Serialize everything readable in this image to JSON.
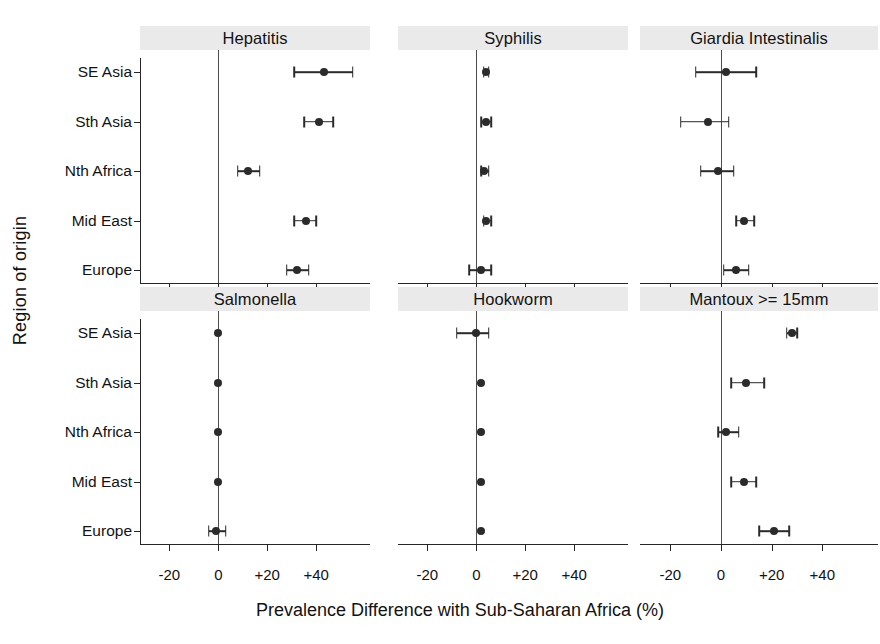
{
  "chart_data": {
    "type": "scatter",
    "subtype": "forest-plot",
    "title": "",
    "xlabel": "Prevalence Difference with Sub-Saharan Africa (%)",
    "ylabel": "Region of origin",
    "xlim": [
      -32,
      62
    ],
    "xticks": [
      -20,
      0,
      20,
      40
    ],
    "xtick_labels": [
      "-20",
      "0",
      "+20",
      "+40"
    ],
    "grid": false,
    "legend": null,
    "reference_line": 0,
    "categories": [
      "SE Asia",
      "Sth Asia",
      "Nth Africa",
      "Mid East",
      "Europe"
    ],
    "panel_layout": {
      "rows": 2,
      "cols": 3
    },
    "panels": [
      {
        "title": "Hepatitis",
        "row": 0,
        "col": 0,
        "points": [
          {
            "category": "SE Asia",
            "value": 43,
            "low": 31,
            "high": 55
          },
          {
            "category": "Sth Asia",
            "value": 41,
            "low": 35,
            "high": 47
          },
          {
            "category": "Nth Africa",
            "value": 12,
            "low": 8,
            "high": 17
          },
          {
            "category": "Mid East",
            "value": 36,
            "low": 31,
            "high": 40
          },
          {
            "category": "Europe",
            "value": 32,
            "low": 28,
            "high": 37
          }
        ]
      },
      {
        "title": "Syphilis",
        "row": 0,
        "col": 1,
        "points": [
          {
            "category": "SE Asia",
            "value": 4,
            "low": 3,
            "high": 5
          },
          {
            "category": "Sth Asia",
            "value": 4,
            "low": 2,
            "high": 6
          },
          {
            "category": "Nth Africa",
            "value": 3,
            "low": 2,
            "high": 5
          },
          {
            "category": "Mid East",
            "value": 4,
            "low": 3,
            "high": 6
          },
          {
            "category": "Europe",
            "value": 2,
            "low": -3,
            "high": 6
          }
        ]
      },
      {
        "title": "Giardia Intestinalis",
        "row": 0,
        "col": 2,
        "points": [
          {
            "category": "SE Asia",
            "value": 2,
            "low": -10,
            "high": 14
          },
          {
            "category": "Sth Asia",
            "value": -5,
            "low": -16,
            "high": 3
          },
          {
            "category": "Nth Africa",
            "value": -1,
            "low": -8,
            "high": 5
          },
          {
            "category": "Mid East",
            "value": 9,
            "low": 6,
            "high": 13
          },
          {
            "category": "Europe",
            "value": 6,
            "low": 1,
            "high": 11
          }
        ]
      },
      {
        "title": "Salmonella",
        "row": 1,
        "col": 0,
        "points": [
          {
            "category": "SE Asia",
            "value": 0,
            "low": 0,
            "high": 0
          },
          {
            "category": "Sth Asia",
            "value": 0,
            "low": 0,
            "high": 0
          },
          {
            "category": "Nth Africa",
            "value": 0,
            "low": 0,
            "high": 0
          },
          {
            "category": "Mid East",
            "value": 0,
            "low": 0,
            "high": 0
          },
          {
            "category": "Europe",
            "value": -1,
            "low": -4,
            "high": 3
          }
        ]
      },
      {
        "title": "Hookworm",
        "row": 1,
        "col": 1,
        "points": [
          {
            "category": "SE Asia",
            "value": 0,
            "low": -8,
            "high": 5
          },
          {
            "category": "Sth Asia",
            "value": 2,
            "low": 2,
            "high": 2
          },
          {
            "category": "Nth Africa",
            "value": 2,
            "low": 2,
            "high": 2
          },
          {
            "category": "Mid East",
            "value": 2,
            "low": 2,
            "high": 2
          },
          {
            "category": "Europe",
            "value": 2,
            "low": 2,
            "high": 2
          }
        ]
      },
      {
        "title": "Mantoux >= 15mm",
        "row": 1,
        "col": 2,
        "points": [
          {
            "category": "SE Asia",
            "value": 28,
            "low": 26,
            "high": 30
          },
          {
            "category": "Sth Asia",
            "value": 10,
            "low": 4,
            "high": 17
          },
          {
            "category": "Nth Africa",
            "value": 2,
            "low": -1,
            "high": 7
          },
          {
            "category": "Mid East",
            "value": 9,
            "low": 4,
            "high": 14
          },
          {
            "category": "Europe",
            "value": 21,
            "low": 15,
            "high": 27
          }
        ]
      }
    ]
  },
  "axis": {
    "ylabel": "Region of origin",
    "xlabel": "Prevalence Difference with Sub-Saharan Africa (%)"
  },
  "colors": {
    "marker": "#2b2b2b",
    "strip_background": "#eaeaea",
    "axis": "#262626",
    "zero_line": "#4d4d4d",
    "text": "#121212"
  }
}
